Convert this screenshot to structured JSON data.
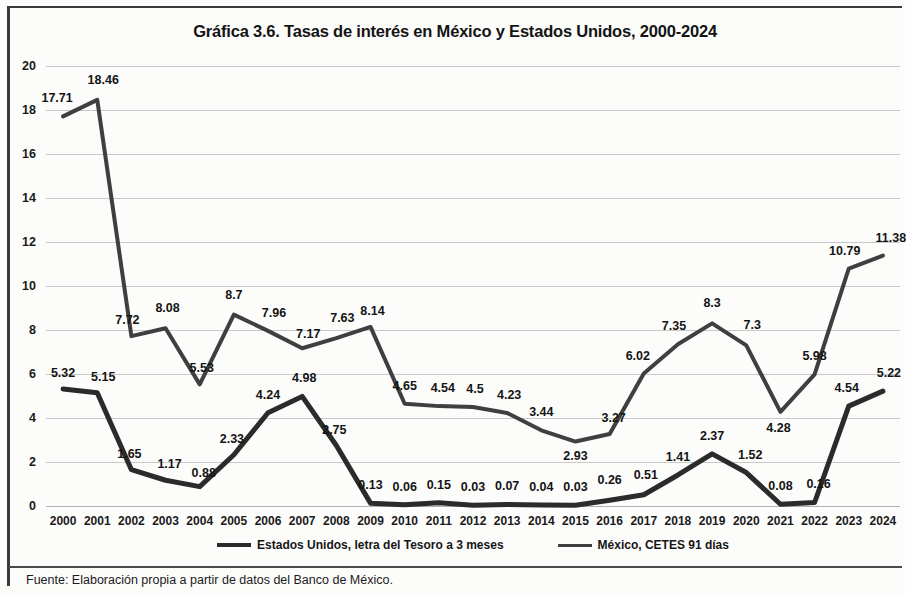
{
  "title": "Gráfica 3.6. Tasas de interés en México y Estados Unidos, 2000-2024",
  "source_note": "Fuente: Elaboración propia a partir de datos del Banco de México.",
  "legend": {
    "items": [
      {
        "label": "Estados Unidos, letra del Tesoro a 3 meses",
        "color": "#2b2b2b"
      },
      {
        "label": "México, CETES 91 días",
        "color": "#3f3f3f"
      }
    ]
  },
  "chart_data": {
    "type": "line",
    "title": "Gráfica 3.6. Tasas de interés en México y Estados Unidos, 2000-2024",
    "xlabel": "",
    "ylabel": "",
    "ylim": [
      0,
      20
    ],
    "ytick_step": 2,
    "yticks": [
      "0",
      "2",
      "4",
      "6",
      "8",
      "10",
      "12",
      "14",
      "16",
      "18",
      "20"
    ],
    "grid": true,
    "legend_position": "bottom",
    "categories": [
      "2000",
      "2001",
      "2002",
      "2003",
      "2004",
      "2005",
      "2006",
      "2007",
      "2008",
      "2009",
      "2010",
      "2011",
      "2012",
      "2013",
      "2014",
      "2015",
      "2016",
      "2017",
      "2018",
      "2019",
      "2020",
      "2021",
      "2022",
      "2023",
      "2024"
    ],
    "series": [
      {
        "name": "Estados Unidos, letra del Tesoro a 3 meses",
        "color": "#2b2b2b",
        "values": [
          5.32,
          5.15,
          1.65,
          1.17,
          0.88,
          2.33,
          4.24,
          4.98,
          2.75,
          0.13,
          0.06,
          0.15,
          0.03,
          0.07,
          0.04,
          0.03,
          0.26,
          0.51,
          1.41,
          2.37,
          1.52,
          0.08,
          0.16,
          4.54,
          5.22
        ],
        "labels": [
          "5.32",
          "5.15",
          "1.65",
          "1.17",
          "0.88",
          "2.33",
          "4.24",
          "4.98",
          "2.75",
          "0.13",
          "0.06",
          "0.15",
          "0.03",
          "0.07",
          "0.04",
          "0.03",
          "0.26",
          "0.51",
          "1.41",
          "2.37",
          "1.52",
          "0.08",
          "0.16",
          "4.54",
          "5.22"
        ]
      },
      {
        "name": "México, CETES 91 días",
        "color": "#3f3f3f",
        "values": [
          17.71,
          18.46,
          7.72,
          8.08,
          5.53,
          8.7,
          7.96,
          7.17,
          7.63,
          8.14,
          4.65,
          4.54,
          4.5,
          4.23,
          3.44,
          2.93,
          3.27,
          6.02,
          7.35,
          8.3,
          7.3,
          4.28,
          5.98,
          10.79,
          11.38
        ],
        "labels": [
          "17.71",
          "18.46",
          "7.72",
          "8.08",
          "5.53",
          "8.7",
          "7.96",
          "7.17",
          "7.63",
          "8.14",
          "4.65",
          "4.54",
          "4.5",
          "4.23",
          "3.44",
          "2.93",
          "3.27",
          "6.02",
          "7.35",
          "8.3",
          "7.3",
          "4.28",
          "5.98",
          "10.79",
          "11.38"
        ]
      }
    ]
  }
}
